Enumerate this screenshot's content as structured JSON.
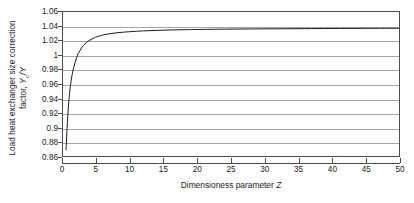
{
  "chart_data": {
    "type": "line",
    "title": "",
    "xlabel": "Dimensioness parameter Z",
    "ylabel": "Load heat exchanger size correction factor, Yc/Y",
    "ylabel_line1": "Load heat exchanger size correction",
    "ylabel_line2_pre": "factor, ",
    "ylabel_sym_y": "Y",
    "ylabel_sym_sub": "c",
    "ylabel_sym_slash": "/Y",
    "xlabel_text": "Dimensioness parameter ",
    "xlabel_sym": "Z",
    "xlim": [
      0,
      50
    ],
    "ylim": [
      0.86,
      1.06
    ],
    "grid": "horizontal",
    "legend": "none",
    "x_ticks": [
      0,
      5,
      10,
      15,
      20,
      25,
      30,
      35,
      40,
      45,
      50
    ],
    "x_tick_labels": [
      "0",
      "5",
      "10",
      "15",
      "20",
      "25",
      "30",
      "35",
      "40",
      "45",
      "50"
    ],
    "y_ticks": [
      0.86,
      0.88,
      0.9,
      0.92,
      0.94,
      0.96,
      0.98,
      1,
      1.02,
      1.04,
      1.06
    ],
    "y_tick_labels": [
      "1.06",
      "1.04",
      "1.02",
      "1",
      "0.98",
      "0.96",
      "0.94",
      "0.92",
      "0.9",
      "0.88",
      "0.86"
    ],
    "series": [
      {
        "name": "Yc/Y vs Z",
        "color": "#1a1a1a",
        "x": [
          0.45,
          0.5,
          0.6,
          0.7,
          0.8,
          0.9,
          1.0,
          1.2,
          1.4,
          1.6,
          1.8,
          2.0,
          2.25,
          2.5,
          2.75,
          3.0,
          3.5,
          4.0,
          4.5,
          5.0,
          6.0,
          7.0,
          8.0,
          9.0,
          10.0,
          12.0,
          14.0,
          16.0,
          18.0,
          20.0,
          24.0,
          28.0,
          32.0,
          36.0,
          40.0,
          45.0,
          50.0
        ],
        "y": [
          0.868,
          0.878,
          0.898,
          0.914,
          0.928,
          0.939,
          0.949,
          0.964,
          0.975,
          0.983,
          0.99,
          0.996,
          1.002,
          1.006,
          1.01,
          1.013,
          1.018,
          1.021,
          1.0235,
          1.0255,
          1.0282,
          1.0299,
          1.0311,
          1.032,
          1.0327,
          1.0338,
          1.0345,
          1.035,
          1.0354,
          1.0357,
          1.0362,
          1.0365,
          1.0367,
          1.0369,
          1.0371,
          1.0373,
          1.0374
        ]
      }
    ],
    "colors": {
      "curve": "#1a1a1a",
      "grid": "#a6a6a6",
      "axis": "#4d4d4d",
      "background": "#ffffff",
      "text": "#1a1a1a"
    }
  }
}
